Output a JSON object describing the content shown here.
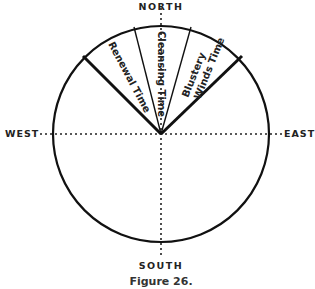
{
  "directions": {
    "north": "NORTH",
    "south": "SOUTH",
    "east": "EAST",
    "west": "WEST"
  },
  "segments": [
    {
      "label": "Renewal Time"
    },
    {
      "label": "Cleansing Time"
    },
    {
      "label": "Blustery"
    },
    {
      "label": "Winds Time"
    }
  ],
  "caption": "Figure 26."
}
